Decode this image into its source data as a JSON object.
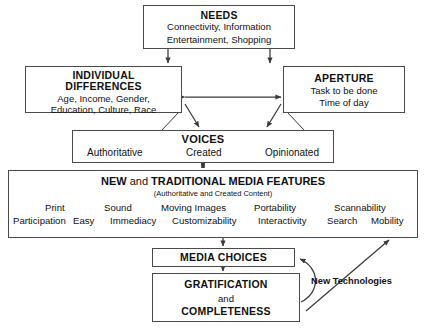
{
  "diagram": {
    "needs": {
      "title": "NEEDS",
      "line1": "Connectivity, Information",
      "line2": "Entertainment, Shopping"
    },
    "individual_differences": {
      "title_line1": "INDIVIDUAL",
      "title_line2": "DIFFERENCES",
      "line1": "Age, Income, Gender,",
      "line2": "Education, Culture, Race"
    },
    "aperture": {
      "title": "APERTURE",
      "line1": "Task to be done",
      "line2": "Time of day"
    },
    "voices": {
      "title": "VOICES",
      "left": "Authoritative",
      "center": "Created",
      "right": "Opinionated"
    },
    "features": {
      "title_new": "NEW",
      "title_and": " and ",
      "title_rest": "TRADITIONAL MEDIA FEATURES",
      "subtitle": "(Authoritative and Created Content)",
      "top_row": [
        "Print",
        "Sound",
        "Moving Images",
        "Portability",
        "Scannability"
      ],
      "bottom_row": [
        "Participation",
        "Easy",
        "Immediacy",
        "Customizability",
        "Interactivity",
        "Search",
        "Mobility"
      ]
    },
    "media_choices": {
      "title": "MEDIA CHOICES"
    },
    "gratification": {
      "line1": "GRATIFICATION",
      "line2": "and",
      "line3": "COMPLETENESS"
    },
    "new_technologies_label": "New Technologies",
    "colors": {
      "stroke": "#3a3a3a",
      "box_border": "#4a4a4a",
      "text": "#111111",
      "background": "#ffffff"
    }
  }
}
